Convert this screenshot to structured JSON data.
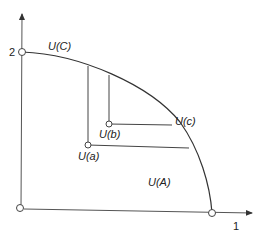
{
  "diagram": {
    "type": "utility-possibility-frontier",
    "axes": {
      "y_tick_label": "2",
      "x_tick_label": "1"
    },
    "labels": {
      "frontier_top": "U(C)",
      "point_a": "U(a)",
      "point_b": "U(b)",
      "point_c": "U(c)",
      "region": "U(A)"
    },
    "colors": {
      "line": "#333333",
      "background": "#ffffff"
    }
  }
}
